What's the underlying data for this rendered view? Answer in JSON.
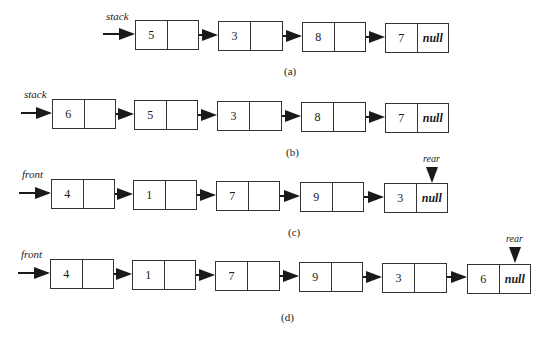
{
  "diagrams": [
    {
      "caption": "(a)",
      "head_label": "stack",
      "nodes": [
        {
          "value": "5",
          "next": ""
        },
        {
          "value": "3",
          "next": ""
        },
        {
          "value": "8",
          "next": ""
        },
        {
          "value": "7",
          "next": "null"
        }
      ]
    },
    {
      "caption": "(b)",
      "head_label": "stack",
      "nodes": [
        {
          "value": "6",
          "next": ""
        },
        {
          "value": "5",
          "next": ""
        },
        {
          "value": "3",
          "next": ""
        },
        {
          "value": "8",
          "next": ""
        },
        {
          "value": "7",
          "next": "null"
        }
      ]
    },
    {
      "caption": "(c)",
      "head_label": "front",
      "tail_label": "rear",
      "nodes": [
        {
          "value": "4",
          "next": ""
        },
        {
          "value": "1",
          "next": ""
        },
        {
          "value": "7",
          "next": ""
        },
        {
          "value": "9",
          "next": ""
        },
        {
          "value": "3",
          "next": "null"
        }
      ]
    },
    {
      "caption": "(d)",
      "head_label": "front",
      "tail_label": "rear",
      "nodes": [
        {
          "value": "4",
          "next": ""
        },
        {
          "value": "1",
          "next": ""
        },
        {
          "value": "7",
          "next": ""
        },
        {
          "value": "9",
          "next": ""
        },
        {
          "value": "3",
          "next": ""
        },
        {
          "value": "6",
          "next": "null"
        }
      ]
    }
  ]
}
